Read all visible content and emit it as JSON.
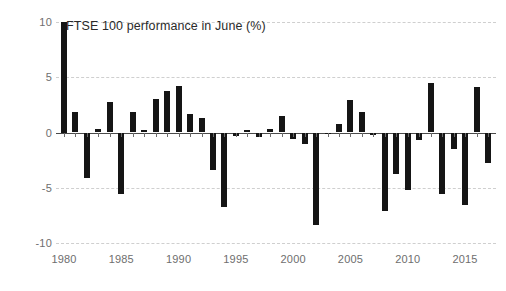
{
  "chart_data": {
    "type": "bar",
    "title": "FTSE 100 performance in June (%)",
    "xlabel": "",
    "ylabel": "",
    "ylim": [
      -10,
      10
    ],
    "xlim": [
      1979.3,
      2017.7
    ],
    "grid": true,
    "legend": null,
    "y_ticks": [
      10,
      5,
      0,
      -5,
      -10
    ],
    "y_tick_labels": [
      "10",
      "5",
      "0",
      "-5",
      "-10"
    ],
    "x_ticks": [
      1980,
      1985,
      1990,
      1995,
      2000,
      2005,
      2010,
      2015
    ],
    "x_tick_labels": [
      "1980",
      "1985",
      "1990",
      "1995",
      "2000",
      "2005",
      "2010",
      "2015"
    ],
    "bar_color": "#151515",
    "gridline_color": "#cfcfcf",
    "axis_color": "#4a4a4a",
    "label_color": "#6e6e6e",
    "categories": [
      "1980",
      "1981",
      "1982",
      "1983",
      "1984",
      "1985",
      "1986",
      "1987",
      "1988",
      "1989",
      "1990",
      "1991",
      "1992",
      "1993",
      "1994",
      "1995",
      "1996",
      "1997",
      "1998",
      "1999",
      "2000",
      "2001",
      "2002",
      "2003",
      "2004",
      "2005",
      "2006",
      "2007",
      "2008",
      "2009",
      "2010",
      "2011",
      "2012",
      "2013",
      "2014",
      "2015",
      "2016",
      "2017"
    ],
    "values": [
      10.0,
      1.9,
      -4.1,
      0.3,
      2.8,
      -5.6,
      1.9,
      0.2,
      3.0,
      3.8,
      4.2,
      1.7,
      1.3,
      -3.4,
      -6.7,
      -0.3,
      0.2,
      -0.4,
      0.3,
      1.5,
      -0.6,
      -1.0,
      -8.4,
      -0.1,
      0.8,
      2.9,
      1.9,
      -0.2,
      -7.1,
      -3.8,
      -5.2,
      -0.7,
      4.5,
      -5.6,
      -1.5,
      -6.6,
      4.1,
      -2.8
    ]
  }
}
